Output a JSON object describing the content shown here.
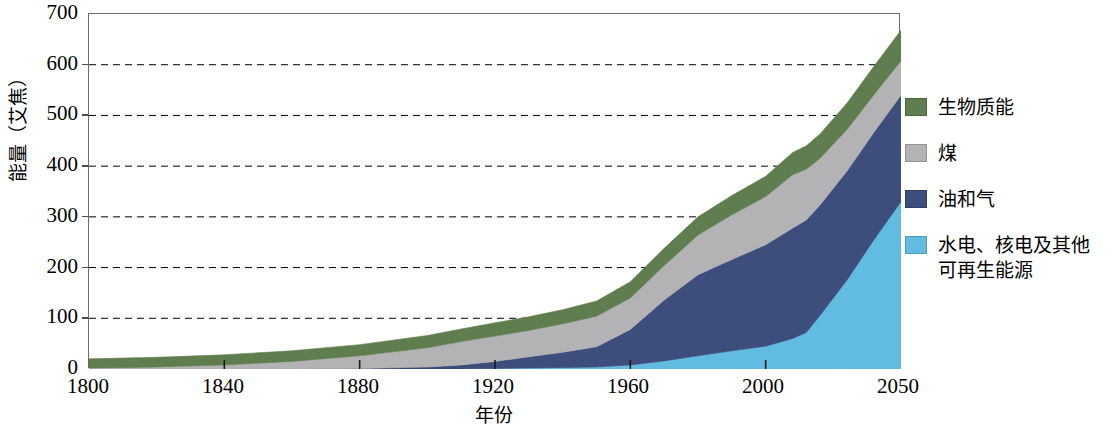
{
  "chart_data": {
    "type": "area",
    "stacked": true,
    "title": "",
    "xlabel": "年份",
    "ylabel": "能量（艾焦）",
    "ylim": [
      0,
      700
    ],
    "yticks": [
      0,
      100,
      200,
      300,
      400,
      500,
      600,
      700
    ],
    "xtick_labels": [
      "1800",
      "1840",
      "1880",
      "1920",
      "1960",
      "2000",
      "2050"
    ],
    "grid": "horizontal-dashed",
    "legend_position": "right",
    "x": [
      1800,
      1820,
      1840,
      1860,
      1880,
      1900,
      1910,
      1920,
      1930,
      1940,
      1950,
      1960,
      1970,
      1980,
      1990,
      2000,
      2010,
      2015,
      2020,
      2030,
      2040,
      2050
    ],
    "series": [
      {
        "name": "水电、核电及其他可再生能源",
        "color": "#62bbe0",
        "values": [
          0,
          0,
          0,
          0,
          0,
          0,
          0,
          1,
          2,
          3,
          4,
          8,
          16,
          26,
          36,
          45,
          60,
          72,
          105,
          175,
          255,
          330
        ]
      },
      {
        "name": "油和气",
        "color": "#3d4e7c",
        "values": [
          0,
          0,
          0,
          0,
          1,
          4,
          8,
          14,
          22,
          30,
          40,
          70,
          120,
          160,
          180,
          200,
          218,
          222,
          218,
          215,
          212,
          210
        ]
      },
      {
        "name": "煤",
        "color": "#b3b3b5",
        "values": [
          2,
          4,
          8,
          15,
          25,
          38,
          46,
          50,
          52,
          56,
          60,
          62,
          68,
          78,
          88,
          95,
          105,
          100,
          92,
          82,
          74,
          68
        ]
      },
      {
        "name": "生物质能",
        "color": "#5f7d4e",
        "values": [
          18,
          19,
          20,
          21,
          22,
          24,
          25,
          26,
          27,
          28,
          30,
          32,
          34,
          36,
          38,
          40,
          44,
          46,
          48,
          52,
          56,
          60
        ]
      }
    ],
    "totals": [
      20,
      23,
      28,
      36,
      48,
      66,
      79,
      91,
      103,
      117,
      134,
      172,
      238,
      300,
      342,
      380,
      427,
      440,
      463,
      524,
      597,
      668
    ]
  },
  "legend": {
    "items": [
      {
        "label": "生物质能",
        "color": "#5f7d4e",
        "icon": "legend-swatch-icon"
      },
      {
        "label": "煤",
        "color": "#b3b3b5",
        "icon": "legend-swatch-icon"
      },
      {
        "label": "油和气",
        "color": "#3d4e7c",
        "icon": "legend-swatch-icon"
      },
      {
        "label": "水电、核电及其他\n可再生能源",
        "color": "#62bbe0",
        "icon": "legend-swatch-icon"
      }
    ]
  },
  "axes": {
    "y_title": "能量（艾焦）",
    "x_title": "年份",
    "y_tick_0": "0",
    "y_tick_1": "100",
    "y_tick_2": "200",
    "y_tick_3": "300",
    "y_tick_4": "400",
    "y_tick_5": "500",
    "y_tick_6": "600",
    "y_tick_7": "700",
    "x_tick_0": "1800",
    "x_tick_1": "1840",
    "x_tick_2": "1880",
    "x_tick_3": "1920",
    "x_tick_4": "1960",
    "x_tick_5": "2000",
    "x_tick_6": "2050"
  }
}
